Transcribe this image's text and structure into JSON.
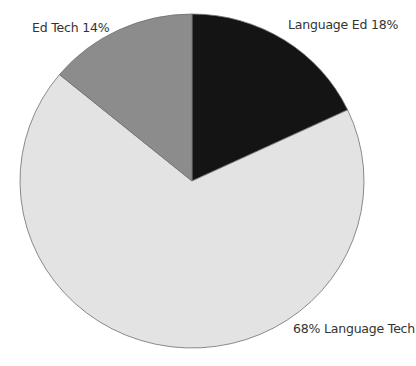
{
  "chart_data": {
    "type": "pie",
    "title": "",
    "start_angle_deg": 0,
    "direction": "clockwise",
    "slices": [
      {
        "name": "Language Ed",
        "value": 18,
        "label": "Language Ed 18%",
        "color": "#141414"
      },
      {
        "name": "Language Tech",
        "value": 68,
        "label": "68% Language Tech",
        "color": "#e3e3e3"
      },
      {
        "name": "Ed Tech",
        "value": 14,
        "label": "Ed Tech 14%",
        "color": "#8c8c8c"
      }
    ],
    "categories": [
      "Language Ed",
      "Language Tech",
      "Ed Tech"
    ],
    "values": [
      18,
      68,
      14
    ],
    "legend": "none (labels placed next to slices)"
  },
  "labels": {
    "language_ed": "Language Ed 18%",
    "language_tech": "68% Language Tech",
    "ed_tech": "Ed Tech 14%"
  }
}
